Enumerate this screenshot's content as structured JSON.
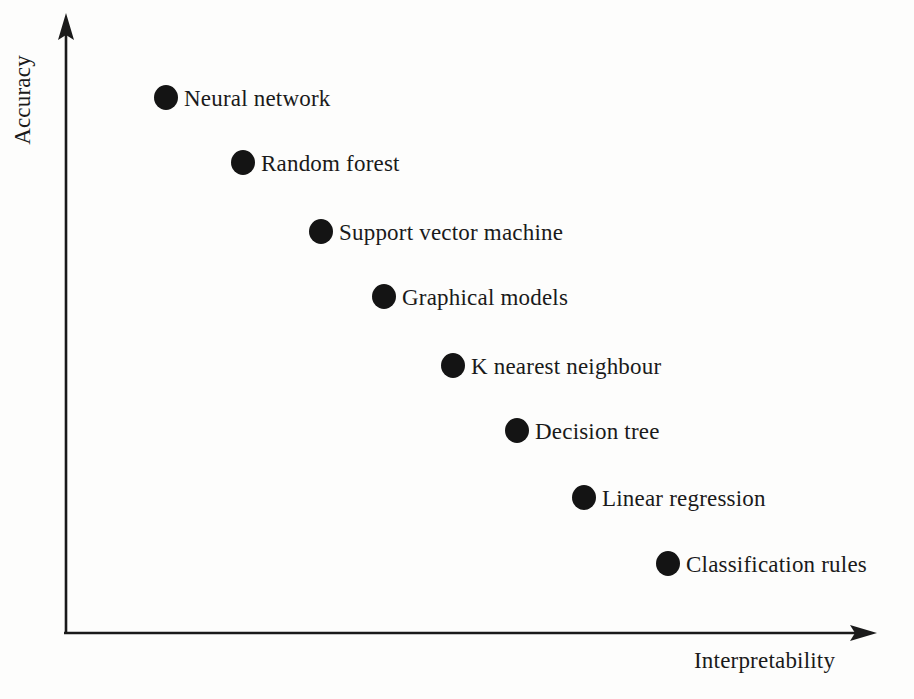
{
  "figure": {
    "background_color": "#fdfdfc",
    "marker_color": "#141414",
    "axis_color": "#1a1a1a",
    "text_color": "#1a1a1a"
  },
  "axes": {
    "y_title": "Accuracy",
    "x_title": "Interpretability",
    "y_arrow_name": "up-arrow-icon",
    "x_arrow_name": "right-arrow-icon"
  },
  "chart_data": {
    "type": "scatter",
    "title": "",
    "xlabel": "Interpretability",
    "ylabel": "Accuracy",
    "xlim": [
      0,
      100
    ],
    "ylim": [
      0,
      100
    ],
    "grid": false,
    "legend": "none",
    "axis_ticks": "none",
    "note": "Qualitative trade-off plot: accuracy decreases as interpretability increases. Axis values are unlabeled; x/y are relative positions read off the pixel layout (0-100 scale).",
    "points": [
      {
        "label": "Neural network",
        "x": 13,
        "y": 89
      },
      {
        "label": "Random forest",
        "x": 22,
        "y": 78
      },
      {
        "label": "Support vector machine",
        "x": 32,
        "y": 67
      },
      {
        "label": "Graphical models",
        "x": 40,
        "y": 56
      },
      {
        "label": "K nearest neighbour",
        "x": 48,
        "y": 45
      },
      {
        "label": "Decision tree",
        "x": 56,
        "y": 34
      },
      {
        "label": "Linear regression",
        "x": 64,
        "y": 23
      },
      {
        "label": "Classification rules",
        "x": 75,
        "y": 12
      }
    ],
    "pixel_positions": [
      {
        "label": "Neural network",
        "cx": 166,
        "cy": 98,
        "r": 12
      },
      {
        "label": "Random forest",
        "cx": 243,
        "cy": 163,
        "r": 12
      },
      {
        "label": "Support vector machine",
        "cx": 321,
        "cy": 232,
        "r": 12
      },
      {
        "label": "Graphical models",
        "cx": 384,
        "cy": 297,
        "r": 12
      },
      {
        "label": "K nearest neighbour",
        "cx": 453,
        "cy": 366,
        "r": 12
      },
      {
        "label": "Decision tree",
        "cx": 517,
        "cy": 431,
        "r": 12
      },
      {
        "label": "Linear regression",
        "cx": 584,
        "cy": 498,
        "r": 12
      },
      {
        "label": "Classification rules",
        "cx": 668,
        "cy": 564,
        "r": 12
      }
    ]
  }
}
